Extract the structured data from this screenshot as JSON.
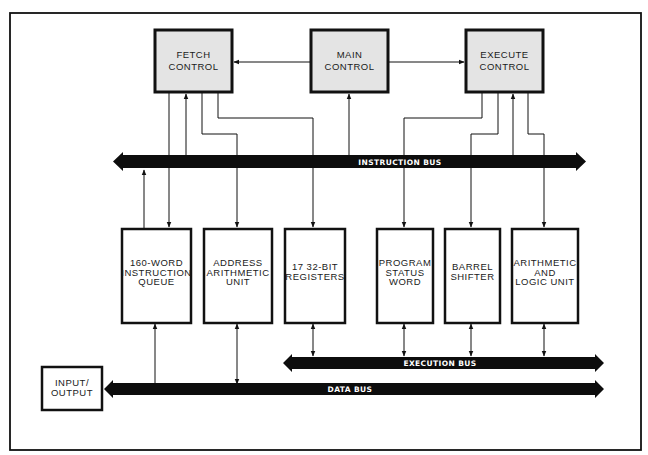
{
  "diagram": {
    "type": "block-diagram",
    "control_blocks": [
      {
        "id": "fetch",
        "lines": [
          "FETCH",
          "CONTROL"
        ]
      },
      {
        "id": "main",
        "lines": [
          "MAIN",
          "CONTROL"
        ]
      },
      {
        "id": "execute",
        "lines": [
          "EXECUTE",
          "CONTROL"
        ]
      }
    ],
    "units": [
      {
        "id": "queue",
        "lines": [
          "160-WORD",
          "INSTRUCTION",
          "QUEUE"
        ]
      },
      {
        "id": "address",
        "lines": [
          "ADDRESS",
          "ARITHMETIC",
          "UNIT"
        ]
      },
      {
        "id": "registers",
        "lines": [
          "17 32-BIT",
          "REGISTERS"
        ]
      },
      {
        "id": "psw",
        "lines": [
          "PROGRAM",
          "STATUS",
          "WORD"
        ]
      },
      {
        "id": "shifter",
        "lines": [
          "BARREL",
          "SHIFTER"
        ]
      },
      {
        "id": "alu",
        "lines": [
          "ARITHMETIC",
          "AND",
          "LOGIC UNIT"
        ]
      }
    ],
    "io": {
      "lines": [
        "INPUT/",
        "OUTPUT"
      ]
    },
    "buses": {
      "instruction": "INSTRUCTION BUS",
      "execution": "EXECUTION BUS",
      "data": "DATA BUS"
    },
    "connections": [
      {
        "from": "main",
        "to": "fetch"
      },
      {
        "from": "main",
        "to": "execute"
      },
      {
        "from": "instruction_bus",
        "to": "main"
      },
      {
        "from": "instruction_bus",
        "to": "fetch"
      },
      {
        "from": "instruction_bus",
        "to": "execute"
      },
      {
        "from": "fetch",
        "to": "queue"
      },
      {
        "from": "fetch",
        "to": "address"
      },
      {
        "from": "fetch",
        "to": "registers"
      },
      {
        "from": "execute",
        "to": "psw"
      },
      {
        "from": "execute",
        "to": "shifter"
      },
      {
        "from": "execute",
        "to": "alu"
      },
      {
        "from": "queue",
        "to": "instruction_bus"
      },
      {
        "from": "data_bus",
        "to": "queue"
      },
      {
        "between": [
          "address",
          "data_bus"
        ],
        "bidirectional": true
      },
      {
        "between": [
          "registers",
          "execution_bus"
        ],
        "bidirectional": true
      },
      {
        "between": [
          "psw",
          "execution_bus"
        ],
        "bidirectional": true
      },
      {
        "between": [
          "shifter",
          "execution_bus"
        ],
        "bidirectional": true
      },
      {
        "between": [
          "alu",
          "execution_bus"
        ],
        "bidirectional": true
      },
      {
        "from": "data_bus",
        "to": "io"
      }
    ]
  }
}
